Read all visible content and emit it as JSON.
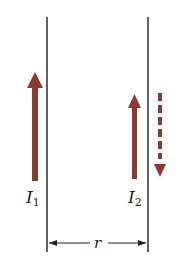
{
  "diagram": {
    "colors": {
      "background": "#ffffff",
      "wire": "#3a3a3a",
      "current_arrow": "#8B3A32",
      "text": "#222222"
    },
    "wires": [
      {
        "id": "wire-1",
        "x": 47,
        "y_top": 17,
        "y_bottom": 252
      },
      {
        "id": "wire-2",
        "x": 148,
        "y_top": 17,
        "y_bottom": 252
      }
    ],
    "currents": [
      {
        "id": "I1",
        "label": "I",
        "subscript": "1",
        "direction": "up",
        "style": "solid"
      },
      {
        "id": "I2",
        "label": "I",
        "subscript": "2",
        "direction": "up",
        "style": "solid"
      },
      {
        "id": "I2-alt",
        "label": "",
        "direction": "down",
        "style": "dashed"
      }
    ],
    "separation": {
      "label": "r"
    }
  }
}
